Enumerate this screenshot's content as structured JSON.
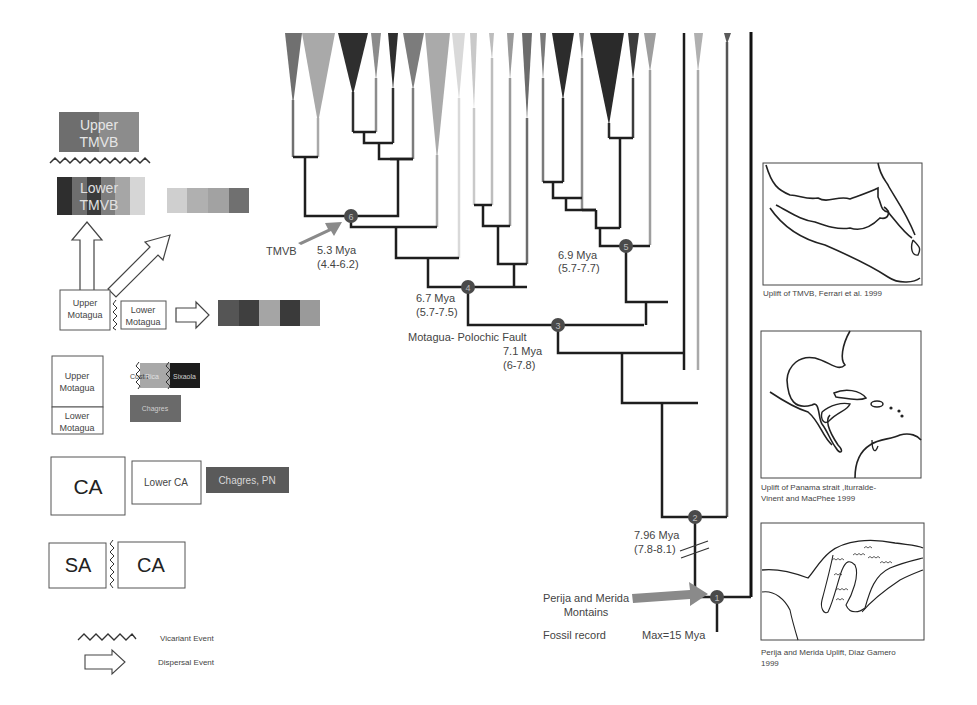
{
  "colors": {
    "branch": "#1e1e1e",
    "node_fill": "#4a4a4a",
    "arrow": "#8a8a8a",
    "box_border": "#555555"
  },
  "legend_left": {
    "upper_tmvb": {
      "label_line1": "Upper",
      "label_line2": "TMVB",
      "colors": [
        "#6e6e6e",
        "#8c8c8c"
      ]
    },
    "lower_tmvb": {
      "label_line1": "Lower",
      "label_line2": "TMVB",
      "colors": [
        "#2e2e2e",
        "#6e6e6e",
        "#3a3a3a",
        "#7e7e7e",
        "#a6a6a6",
        "#d6d6d6"
      ]
    },
    "tmvb_dispersal_swatches": [
      "#cfcfcf",
      "#b0b0b0",
      "#a2a2a2",
      "#707070"
    ],
    "upper_motagua": {
      "line1": "Upper",
      "line2": "Motagua"
    },
    "lower_motagua": {
      "line1": "Lower",
      "line2": "Motagua"
    },
    "motagua_dispersal_swatches": [
      "#555555",
      "#3f3f3f",
      "#a5a5a5",
      "#3a3a3a",
      "#9a9a9a"
    ],
    "upper_motagua_2": {
      "line1": "Upper",
      "line2": "Motagua"
    },
    "lower_motagua_2": {
      "line1": "Lower",
      "line2": "Motagua"
    },
    "costa_rica": {
      "left": "Costa",
      "right": "Rica"
    },
    "sixaola": "Sixaola",
    "chagres": "Chagres",
    "ca_box": "CA",
    "lower_ca_box": "Lower CA",
    "chagres_pn": "Chagres, PN",
    "sa_box": "SA",
    "ca_box_2": "CA",
    "key": [
      {
        "symbol": "zigzag",
        "label": "Vicariant Event"
      },
      {
        "symbol": "hollow-arrow",
        "label": "Dispersal Event"
      }
    ]
  },
  "tree": {
    "nodes": [
      {
        "id": "1",
        "x": 717,
        "y": 597
      },
      {
        "id": "2",
        "x": 695,
        "y": 517
      },
      {
        "id": "3",
        "x": 558,
        "y": 325
      },
      {
        "id": "4",
        "x": 468,
        "y": 287
      },
      {
        "id": "5",
        "x": 626,
        "y": 246
      },
      {
        "id": "6",
        "x": 351,
        "y": 216
      }
    ],
    "annotations": {
      "node6_event": "TMVB",
      "node6_age": "5.3 Mya",
      "node6_range": "(4.4-6.2)",
      "node4_age": "6.7 Mya",
      "node4_range": "(5.7-7.5)",
      "node5_age": "6.9 Mya",
      "node5_range": "(5.7-7.7)",
      "node3_event": "Motagua- Polochic Fault",
      "node3_age": "7.1 Mya",
      "node3_range": "(6-7.8)",
      "node2_age": "7.96 Mya",
      "node2_range": "(7.8-8.1)",
      "node1_event_line1": "Perija and Merida",
      "node1_event_line2": "Montains",
      "fossil_label": "Fossil record",
      "fossil_max": "Max=15 Mya"
    }
  },
  "maps": [
    {
      "caption": "Uplift of TMVB, Ferrari et al. 1999"
    },
    {
      "caption_line1": "Uplift of Panama strait ,Iturralde-",
      "caption_line2": "Vinent and MacPhee 1999"
    },
    {
      "caption_line1": "Perija and Merida Uplift, Diaz Gamero",
      "caption_line2": "1999"
    }
  ]
}
